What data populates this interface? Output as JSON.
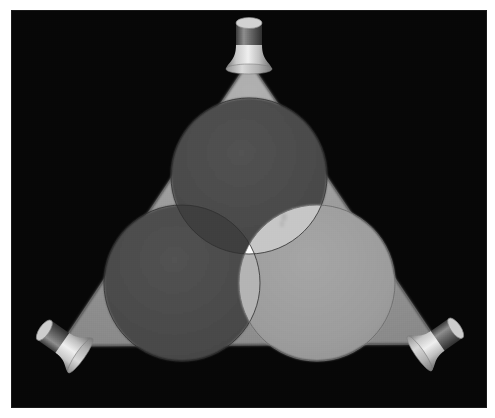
{
  "scene": {
    "title": "Additive light mixing with three spotlights",
    "description": "Three spotlights aimed at a dark surface project overlapping circular pools of light forming a triangular field; the region common to all three lights is brightest white.",
    "background_color": "#060606",
    "frame": {
      "page_background": "#ffffff",
      "border_color": "#1a1a1a",
      "x": 12,
      "y": 11,
      "width": 474,
      "height": 396
    },
    "triangle": {
      "name": "illuminated-floor-triangle",
      "fill_color": "#969696",
      "vertices": [
        {
          "label": "apex-top",
          "x": 237,
          "y": 50
        },
        {
          "label": "vertex-bottom-left",
          "x": 48,
          "y": 335
        },
        {
          "label": "vertex-bottom-right",
          "x": 427,
          "y": 333
        }
      ]
    },
    "lamps": [
      {
        "id": "lamp-top",
        "label": "Top spotlight",
        "position": {
          "x": 237,
          "y": 36
        },
        "rotation_deg": 0,
        "reflector_color": "#d8d8d8",
        "barrel_color": "#5a5a5a",
        "lens_color": "#cfcfcf"
      },
      {
        "id": "lamp-bottom-left",
        "label": "Bottom-left spotlight",
        "position": {
          "x": 52,
          "y": 333
        },
        "rotation_deg": 125,
        "reflector_color": "#cfcfcf",
        "barrel_color": "#4e4e4e",
        "lens_color": "#c4c4c4"
      },
      {
        "id": "lamp-bottom-right",
        "label": "Bottom-right spotlight",
        "position": {
          "x": 424,
          "y": 331
        },
        "rotation_deg": -125,
        "reflector_color": "#d2d2d2",
        "barrel_color": "#585858",
        "lens_color": "#c8c8c8"
      }
    ],
    "light_pools": [
      {
        "id": "pool-top",
        "label": "Top light pool",
        "source_lamp": "lamp-top",
        "center": {
          "x": 237,
          "y": 165
        },
        "radius": 78,
        "fill_color": "#4b4b4b",
        "edge_color": "#2e2e2e"
      },
      {
        "id": "pool-left",
        "label": "Lower-left light pool",
        "source_lamp": "lamp-bottom-left",
        "center": {
          "x": 170,
          "y": 272
        },
        "radius": 78,
        "fill_color": "#4b4b4b",
        "edge_color": "#2e2e2e"
      },
      {
        "id": "pool-right",
        "label": "Lower-right light pool",
        "source_lamp": "lamp-bottom-right",
        "center": {
          "x": 305,
          "y": 272
        },
        "radius": 78,
        "fill_color": "#9d9d9d",
        "edge_color": "#6b6b6b"
      }
    ],
    "overlap_regions": [
      {
        "id": "overlap-top-left",
        "label": "Top + Left overlap",
        "fill_color": "#3f3f3f"
      },
      {
        "id": "overlap-top-right",
        "label": "Top + Right overlap",
        "fill_color": "#c6c6c6"
      },
      {
        "id": "overlap-left-right",
        "label": "Left + Right overlap",
        "fill_color": "#b4b4b4"
      },
      {
        "id": "overlap-all-three",
        "label": "All three overlap (white)",
        "fill_color": "#fdfdfd"
      }
    ],
    "artifacts": [
      {
        "id": "dust-speck",
        "label": "Faint dust speck on light pool",
        "x": 272,
        "y": 208,
        "opacity": 0.18
      }
    ]
  }
}
